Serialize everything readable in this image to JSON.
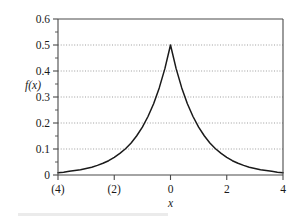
{
  "chart_data": {
    "type": "line",
    "title": "",
    "subtitle": "",
    "xlabel": "x",
    "ylabel": "f(x)",
    "xlim": [
      -4,
      4
    ],
    "ylim": [
      0,
      0.6
    ],
    "grid": true,
    "grid_axis": "y",
    "legend": false,
    "legend_position": "none",
    "x_ticks": [
      -4,
      -2,
      0,
      2,
      4
    ],
    "x_tick_labels": [
      "(4)",
      "(2)",
      "0",
      "2",
      "4"
    ],
    "y_ticks": [
      0,
      0.1,
      0.2,
      0.3,
      0.4,
      0.5,
      0.6
    ],
    "y_tick_labels": [
      "0",
      "0.1",
      "0.2",
      "0.3",
      "0.4",
      "0.5",
      "0.6"
    ],
    "y_minor_ticks": [
      0.05,
      0.15,
      0.25,
      0.35,
      0.45,
      0.55
    ],
    "curve_color": "#1a1a1a",
    "grid_color": "#8d8d8d",
    "frame_color": "#4a4a4a",
    "series": [
      {
        "name": "f(x) = 0.5*e^(-|x|)",
        "x": [
          -4,
          -3.8,
          -3.6,
          -3.4,
          -3.2,
          -3,
          -2.8,
          -2.6,
          -2.4,
          -2.2,
          -2,
          -1.8,
          -1.6,
          -1.4,
          -1.2,
          -1,
          -0.8,
          -0.6,
          -0.4,
          -0.2,
          0,
          0.2,
          0.4,
          0.6,
          0.8,
          1,
          1.2,
          1.4,
          1.6,
          1.8,
          2,
          2.2,
          2.4,
          2.6,
          2.8,
          3,
          3.2,
          3.4,
          3.6,
          3.8,
          4
        ],
        "values": [
          0.009,
          0.011,
          0.014,
          0.017,
          0.02,
          0.025,
          0.03,
          0.037,
          0.045,
          0.055,
          0.068,
          0.083,
          0.101,
          0.123,
          0.151,
          0.184,
          0.225,
          0.274,
          0.335,
          0.409,
          0.5,
          0.409,
          0.335,
          0.274,
          0.225,
          0.184,
          0.151,
          0.123,
          0.101,
          0.083,
          0.068,
          0.055,
          0.045,
          0.037,
          0.03,
          0.025,
          0.02,
          0.017,
          0.014,
          0.011,
          0.009
        ]
      }
    ],
    "annotations": [
      {
        "text": "peak",
        "x": 0,
        "y": 0.5
      }
    ]
  }
}
